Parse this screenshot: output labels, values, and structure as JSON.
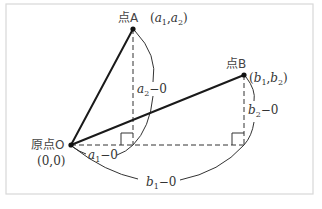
{
  "diagram": {
    "type": "coordinate-distance-illustration",
    "points": {
      "A": {
        "name": "点A",
        "coords_label": "(a1,a2)",
        "var1": "a",
        "sub1": "1",
        "var2": "a",
        "sub2": "2"
      },
      "B": {
        "name": "点B",
        "coords_label": "(b1,b2)",
        "var1": "b",
        "sub1": "1",
        "var2": "b",
        "sub2": "2"
      },
      "O": {
        "name": "原点O",
        "coords_label": "(0,0)"
      }
    },
    "labels": {
      "pointA": "点A",
      "pointA_coords_open": "(",
      "pointA_a": "a",
      "pointA_sub1": "1",
      "comma": ",",
      "pointA_sub2": "2",
      "close": ")",
      "pointB": "点B",
      "pointB_b": "b",
      "pointB_sub1": "1",
      "pointB_sub2": "2",
      "origin": "原点O",
      "origin_coords": "(0,0)",
      "a2_minus": "−0",
      "a1_minus": "−0",
      "b2_minus": "−0",
      "b1_minus": "−0",
      "var_a": "a",
      "var_b": "b",
      "sub_1": "1",
      "sub_2": "2"
    },
    "measurements": [
      {
        "label": "a2−0",
        "meaning": "vertical distance from A to x-axis"
      },
      {
        "label": "a1−0",
        "meaning": "horizontal distance from O to foot of A"
      },
      {
        "label": "b2−0",
        "meaning": "vertical distance from B to x-axis"
      },
      {
        "label": "b1−0",
        "meaning": "horizontal distance from O to foot of B"
      }
    ]
  }
}
